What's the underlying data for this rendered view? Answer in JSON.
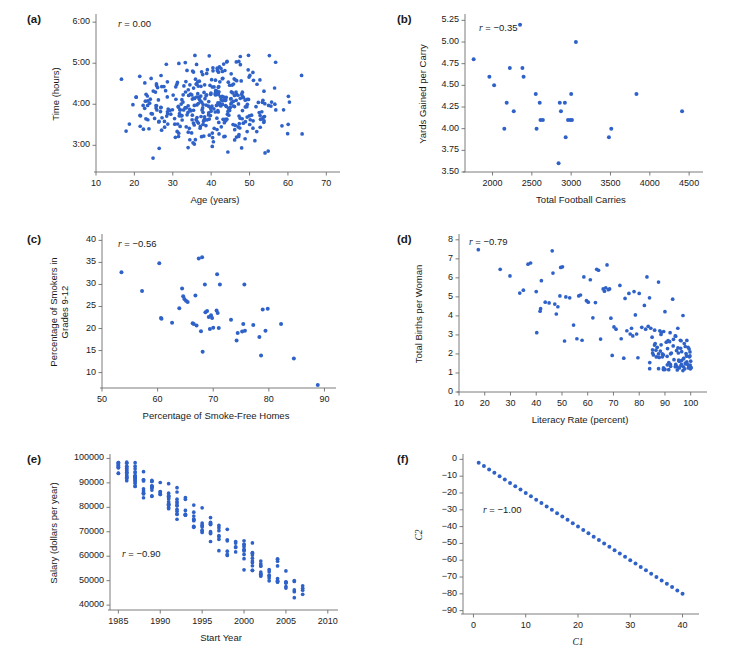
{
  "figure": {
    "background": "#ffffff",
    "dot_color": "#2f62c8",
    "axis_color": "#6d6d6d",
    "panels": [
      "a",
      "b",
      "c",
      "d",
      "e",
      "f"
    ]
  },
  "chart_data": [
    {
      "panel": "a",
      "type": "scatter",
      "title": "",
      "xlabel": "Age (years)",
      "ylabel": "Time (hours)",
      "annotation": "r = 0.00",
      "r": 0.0,
      "xlim": [
        10,
        72
      ],
      "ylim": [
        2.35,
        6.15
      ],
      "xticks": [
        10,
        20,
        30,
        40,
        50,
        60,
        70
      ],
      "xticklabels": [
        "10",
        "20",
        "30",
        "40",
        "50",
        "60",
        "70"
      ],
      "yticks": [
        3,
        4,
        5,
        6
      ],
      "yticklabels": [
        "3:00",
        "4:00",
        "5:00",
        "6:00"
      ],
      "grid": false,
      "n_points": 380,
      "generator": {
        "kind": "gaussian-cloud",
        "seed": 17,
        "x_mean": 39.0,
        "x_sd": 9.2,
        "x_min": 16.5,
        "x_max": 70.5,
        "y_mean": 3.98,
        "y_sd": 0.52,
        "y_min": 2.5,
        "y_max": 5.95,
        "rho": 0.0
      }
    },
    {
      "panel": "b",
      "type": "scatter",
      "title": "",
      "xlabel": "Total Football Carries",
      "ylabel": "Yards Gained per Carry",
      "annotation": "r = −0.35",
      "r": -0.35,
      "xlim": [
        1650,
        4600
      ],
      "ylim": [
        3.5,
        5.3
      ],
      "xticks": [
        2000,
        2500,
        3000,
        3500,
        4000,
        4500
      ],
      "xticklabels": [
        "2000",
        "2500",
        "3000",
        "3500",
        "4000",
        "4500"
      ],
      "yticks": [
        3.5,
        3.75,
        4.0,
        4.25,
        4.5,
        4.75,
        5.0,
        5.25
      ],
      "yticklabels": [
        "3.50",
        "3.75",
        "4.00",
        "4.25",
        "4.50",
        "4.75",
        "5.00",
        "5.25"
      ],
      "grid": false,
      "points": [
        [
          1760,
          4.8
        ],
        [
          1960,
          4.6
        ],
        [
          2020,
          4.5
        ],
        [
          2150,
          4.0
        ],
        [
          2180,
          4.3
        ],
        [
          2220,
          4.7
        ],
        [
          2270,
          4.2
        ],
        [
          2350,
          5.2
        ],
        [
          2380,
          4.7
        ],
        [
          2395,
          4.6
        ],
        [
          2550,
          4.4
        ],
        [
          2560,
          4.0
        ],
        [
          2600,
          4.3
        ],
        [
          2610,
          4.1
        ],
        [
          2640,
          4.1
        ],
        [
          2840,
          3.6
        ],
        [
          2855,
          4.3
        ],
        [
          2870,
          4.2
        ],
        [
          2920,
          4.3
        ],
        [
          2930,
          3.9
        ],
        [
          2960,
          4.1
        ],
        [
          2990,
          4.1
        ],
        [
          3000,
          4.4
        ],
        [
          3010,
          4.1
        ],
        [
          3060,
          5.0
        ],
        [
          3480,
          3.9
        ],
        [
          3510,
          4.0
        ],
        [
          3830,
          4.4
        ],
        [
          4410,
          4.2
        ]
      ]
    },
    {
      "panel": "c",
      "type": "scatter",
      "title": "",
      "xlabel": "Percentage of Smoke-Free Homes",
      "ylabel": "Percentage of Smokers in\nGrades 9-12",
      "ylabel_lines": [
        "Percentage of Smokers in",
        "Grades 9-12"
      ],
      "annotation": "r = −0.56",
      "r": -0.56,
      "xlim": [
        50,
        91
      ],
      "ylim": [
        6.5,
        41
      ],
      "xticks": [
        50,
        60,
        70,
        80,
        90
      ],
      "xticklabels": [
        "50",
        "60",
        "70",
        "80",
        "90"
      ],
      "yticks": [
        10,
        15,
        20,
        25,
        30,
        35,
        40
      ],
      "yticklabels": [
        "10",
        "15",
        "20",
        "25",
        "30",
        "35",
        "40"
      ],
      "grid": false,
      "points": [
        [
          53.5,
          32.8
        ],
        [
          57.2,
          28.5
        ],
        [
          60.3,
          34.8
        ],
        [
          60.6,
          22.4
        ],
        [
          60.7,
          22.2
        ],
        [
          62.6,
          21.3
        ],
        [
          63.9,
          24.6
        ],
        [
          64.4,
          29.1
        ],
        [
          64.6,
          27.3
        ],
        [
          64.8,
          26.7
        ],
        [
          65.1,
          26.3
        ],
        [
          65.4,
          26.0
        ],
        [
          66.3,
          21.2
        ],
        [
          66.5,
          21.0
        ],
        [
          66.8,
          27.5
        ],
        [
          67.0,
          20.7
        ],
        [
          67.4,
          35.9
        ],
        [
          67.8,
          19.4
        ],
        [
          68.0,
          36.2
        ],
        [
          68.1,
          14.7
        ],
        [
          68.5,
          30.0
        ],
        [
          68.6,
          23.7
        ],
        [
          68.9,
          24.0
        ],
        [
          69.2,
          22.6
        ],
        [
          69.4,
          19.9
        ],
        [
          69.6,
          23.0
        ],
        [
          69.8,
          22.4
        ],
        [
          70.0,
          20.2
        ],
        [
          70.6,
          24.1
        ],
        [
          70.7,
          32.3
        ],
        [
          70.8,
          23.5
        ],
        [
          71.0,
          20.1
        ],
        [
          71.2,
          30.0
        ],
        [
          73.2,
          22.0
        ],
        [
          74.2,
          17.3
        ],
        [
          74.4,
          19.0
        ],
        [
          75.2,
          19.3
        ],
        [
          75.4,
          21.0
        ],
        [
          75.6,
          30.0
        ],
        [
          75.7,
          19.5
        ],
        [
          77.2,
          20.8
        ],
        [
          78.3,
          18.1
        ],
        [
          78.6,
          13.9
        ],
        [
          78.9,
          24.3
        ],
        [
          79.4,
          19.5
        ],
        [
          79.8,
          24.5
        ],
        [
          82.2,
          21.0
        ],
        [
          84.5,
          13.2
        ],
        [
          88.8,
          7.2
        ]
      ]
    },
    {
      "panel": "d",
      "type": "scatter",
      "title": "",
      "xlabel": "Literacy Rate (percent)",
      "ylabel": "Total Births per Woman",
      "annotation": "r = −0.79",
      "r": -0.79,
      "xlim": [
        10,
        104
      ],
      "ylim": [
        0,
        8.2
      ],
      "xticks": [
        10,
        20,
        30,
        40,
        50,
        60,
        70,
        80,
        90,
        100
      ],
      "xticklabels": [
        "10",
        "20",
        "30",
        "40",
        "50",
        "60",
        "70",
        "80",
        "90",
        "100"
      ],
      "yticks": [
        0,
        1,
        2,
        3,
        4,
        5,
        6,
        7,
        8
      ],
      "yticklabels": [
        "0",
        "1",
        "2",
        "3",
        "4",
        "5",
        "6",
        "7",
        "8"
      ],
      "grid": false,
      "n_points": 165,
      "generator": {
        "kind": "literacy-fertility",
        "seed": 91,
        "cluster_x_min": 84,
        "cluster_x_max": 100,
        "cluster_y_min": 1.0,
        "cluster_y_max": 3.3,
        "cluster_fraction": 0.46
      },
      "points": [
        [
          17.5,
          7.48
        ],
        [
          26.0,
          6.45
        ],
        [
          29.8,
          6.1
        ],
        [
          33.6,
          5.2
        ],
        [
          35.0,
          5.35
        ],
        [
          36.8,
          6.72
        ],
        [
          37.8,
          6.78
        ],
        [
          40.0,
          5.28
        ],
        [
          40.2,
          3.12
        ],
        [
          41.5,
          4.25
        ],
        [
          41.7,
          4.38
        ],
        [
          42.0,
          5.85
        ],
        [
          43.5,
          4.72
        ],
        [
          45.0,
          4.68
        ],
        [
          46.2,
          7.42
        ],
        [
          46.5,
          6.25
        ],
        [
          47.2,
          4.62
        ],
        [
          47.8,
          4.1
        ],
        [
          48.4,
          4.48
        ],
        [
          49.2,
          5.05
        ],
        [
          49.5,
          6.55
        ],
        [
          50.2,
          6.58
        ],
        [
          51.0,
          2.68
        ],
        [
          51.5,
          5.0
        ],
        [
          53.0,
          4.95
        ],
        [
          54.5,
          3.52
        ],
        [
          55.8,
          2.8
        ],
        [
          56.5,
          5.05
        ],
        [
          57.2,
          5.1
        ],
        [
          57.8,
          2.72
        ],
        [
          58.5,
          6.05
        ],
        [
          59.5,
          4.8
        ],
        [
          60.2,
          4.72
        ],
        [
          61.0,
          5.9
        ],
        [
          62.0,
          3.9
        ],
        [
          63.0,
          4.7
        ],
        [
          63.5,
          6.45
        ],
        [
          64.2,
          6.4
        ],
        [
          65.0,
          2.78
        ],
        [
          66.0,
          5.42
        ],
        [
          66.5,
          5.3
        ],
        [
          67.0,
          5.48
        ],
        [
          67.5,
          6.68
        ],
        [
          68.0,
          5.38
        ],
        [
          68.5,
          5.42
        ],
        [
          69.0,
          3.88
        ],
        [
          69.5,
          1.92
        ],
        [
          70.2,
          3.42
        ],
        [
          71.0,
          3.3
        ],
        [
          72.5,
          5.6
        ],
        [
          73.0,
          2.8
        ],
        [
          74.0,
          1.78
        ],
        [
          74.5,
          4.92
        ],
        [
          75.2,
          3.22
        ],
        [
          76.0,
          5.18
        ],
        [
          76.5,
          3.05
        ],
        [
          77.0,
          3.35
        ],
        [
          77.5,
          2.95
        ],
        [
          78.0,
          5.28
        ],
        [
          78.5,
          4.05
        ],
        [
          79.0,
          3.05
        ],
        [
          79.5,
          1.8
        ],
        [
          80.0,
          5.18
        ],
        [
          81.0,
          3.4
        ],
        [
          82.0,
          4.55
        ],
        [
          82.5,
          3.3
        ],
        [
          83.0,
          6.05
        ],
        [
          83.5,
          3.45
        ],
        [
          84.0,
          4.95
        ],
        [
          84.5,
          3.35
        ],
        [
          85.0,
          2.88
        ],
        [
          85.2,
          2.05
        ],
        [
          85.5,
          1.95
        ],
        [
          86.0,
          3.25
        ],
        [
          86.2,
          2.55
        ],
        [
          86.5,
          2.2
        ],
        [
          87.0,
          2.35
        ],
        [
          87.5,
          5.78
        ],
        [
          88.0,
          3.22
        ],
        [
          88.2,
          2.15
        ],
        [
          88.5,
          2.48
        ],
        [
          89.0,
          1.85
        ],
        [
          89.5,
          3.18
        ],
        [
          90.0,
          4.22
        ],
        [
          90.5,
          2.62
        ],
        [
          91.0,
          2.28
        ],
        [
          91.5,
          1.55
        ],
        [
          92.0,
          3.12
        ],
        [
          92.2,
          1.35
        ],
        [
          92.5,
          2.05
        ],
        [
          93.0,
          4.88
        ],
        [
          93.2,
          2.42
        ],
        [
          93.5,
          1.7
        ],
        [
          94.0,
          2.95
        ],
        [
          94.2,
          1.45
        ],
        [
          94.5,
          2.18
        ],
        [
          95.0,
          3.35
        ],
        [
          95.2,
          2.05
        ],
        [
          95.5,
          1.62
        ],
        [
          96.0,
          2.72
        ],
        [
          96.2,
          1.38
        ],
        [
          96.5,
          2.12
        ],
        [
          97.0,
          4.02
        ],
        [
          97.2,
          1.75
        ],
        [
          97.5,
          2.55
        ],
        [
          98.0,
          1.48
        ],
        [
          98.2,
          2.02
        ],
        [
          98.5,
          1.58
        ],
        [
          99.0,
          2.35
        ],
        [
          99.2,
          1.32
        ],
        [
          99.5,
          1.85
        ],
        [
          99.8,
          1.42
        ],
        [
          100.0,
          1.62
        ],
        [
          100.2,
          1.28
        ]
      ]
    },
    {
      "panel": "e",
      "type": "scatter",
      "title": "",
      "xlabel": "Start Year",
      "ylabel": "Salary (dollars per year)",
      "annotation": "r = −0.90",
      "r": -0.9,
      "xlim": [
        1984,
        2010.5
      ],
      "ylim": [
        38000,
        101000
      ],
      "xticks": [
        1985,
        1990,
        1995,
        2000,
        2005,
        2010
      ],
      "xticklabels": [
        "1985",
        "1990",
        "1995",
        "2000",
        "2005",
        "2010"
      ],
      "yticks": [
        40000,
        50000,
        60000,
        70000,
        80000,
        90000,
        100000
      ],
      "yticklabels": [
        "40000",
        "50000",
        "60000",
        "70000",
        "80000",
        "90000",
        "100000"
      ],
      "grid": false,
      "n_points": 210,
      "generator": {
        "kind": "year-salary-columns",
        "seed": 404,
        "year_min": 1985,
        "year_max": 2007,
        "intercept": 97500,
        "slope": -2400,
        "spread": 7200
      }
    },
    {
      "panel": "f",
      "type": "scatter",
      "title": "",
      "xlabel": "C1",
      "xlabel_italic": true,
      "ylabel": "C2",
      "ylabel_italic": true,
      "annotation": "r = −1.00",
      "r": -1.0,
      "xlim": [
        -2,
        42
      ],
      "ylim": [
        -92,
        2
      ],
      "xticks": [
        0,
        10,
        20,
        30,
        40
      ],
      "xticklabels": [
        "0",
        "10",
        "20",
        "30",
        "40"
      ],
      "yticks": [
        -90,
        -80,
        -70,
        -60,
        -50,
        -40,
        -30,
        -20,
        -10,
        0
      ],
      "yticklabels": [
        "−90",
        "−80",
        "−70",
        "−60",
        "−50",
        "−40",
        "−30",
        "−20",
        "−10",
        "0"
      ],
      "grid": false,
      "generator": {
        "kind": "linear-exact",
        "x_start": 1,
        "x_end": 40,
        "x_step": 1,
        "slope": -2,
        "intercept": 0
      }
    }
  ]
}
